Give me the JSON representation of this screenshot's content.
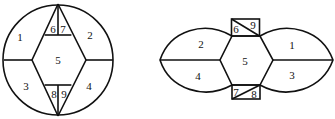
{
  "figures": [
    {
      "id": "left",
      "shape": "circle",
      "regions": [
        {
          "label": "1",
          "x": 20,
          "y": 41
        },
        {
          "label": "2",
          "x": 90,
          "y": 39
        },
        {
          "label": "3",
          "x": 26,
          "y": 90
        },
        {
          "label": "4",
          "x": 89,
          "y": 90
        },
        {
          "label": "5",
          "x": 58,
          "y": 64
        },
        {
          "label": "6",
          "x": 53,
          "y": 33
        },
        {
          "label": "7",
          "x": 63,
          "y": 33
        },
        {
          "label": "8",
          "x": 54,
          "y": 98
        },
        {
          "label": "9",
          "x": 64,
          "y": 98
        }
      ]
    },
    {
      "id": "right",
      "shape": "lens",
      "regions": [
        {
          "label": "2",
          "x": 201,
          "y": 48
        },
        {
          "label": "1",
          "x": 292,
          "y": 49
        },
        {
          "label": "4",
          "x": 198,
          "y": 80
        },
        {
          "label": "3",
          "x": 292,
          "y": 79
        },
        {
          "label": "5",
          "x": 245,
          "y": 65
        },
        {
          "label": "6",
          "x": 236,
          "y": 33
        },
        {
          "label": "9",
          "x": 253,
          "y": 29
        },
        {
          "label": "7",
          "x": 236,
          "y": 96
        },
        {
          "label": "8",
          "x": 254,
          "y": 98
        }
      ]
    }
  ]
}
